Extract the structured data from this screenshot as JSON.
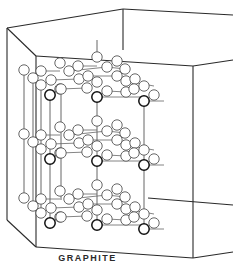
{
  "figure": {
    "caption": "GRAPHITE",
    "colors": {
      "line": "#2a2a2a",
      "background": "#ffffff",
      "atom_fill": "#ffffff"
    }
  },
  "box": {
    "edges": [
      [
        7,
        28,
        123,
        9
      ],
      [
        123,
        9,
        233,
        15
      ],
      [
        7,
        28,
        36,
        56
      ],
      [
        36,
        56,
        193,
        66
      ],
      [
        193,
        66,
        233,
        60
      ],
      [
        123,
        9,
        123,
        50
      ],
      [
        7,
        28,
        7,
        220
      ],
      [
        36,
        56,
        36,
        247
      ],
      [
        193,
        66,
        193,
        258
      ],
      [
        7,
        220,
        36,
        247
      ],
      [
        36,
        247,
        193,
        258
      ],
      [
        193,
        258,
        233,
        252
      ],
      [
        148,
        198,
        233,
        205
      ]
    ]
  },
  "layers": [
    {
      "name": "top-layer",
      "dy": 0
    },
    {
      "name": "middle-layer",
      "dy": 64
    },
    {
      "name": "bottom-layer",
      "dy": 128
    }
  ],
  "atoms": [
    [
      24,
      70
    ],
    [
      41,
      71
    ],
    [
      33,
      78
    ],
    [
      60,
      63
    ],
    [
      69,
      71
    ],
    [
      78,
      66
    ],
    [
      97,
      57
    ],
    [
      107,
      67
    ],
    [
      117,
      61
    ],
    [
      125,
      69
    ],
    [
      41,
      85
    ],
    [
      51,
      80
    ],
    [
      60,
      89
    ],
    [
      79,
      79
    ],
    [
      88,
      76
    ],
    [
      97,
      82
    ],
    [
      117,
      76
    ],
    [
      126,
      81
    ],
    [
      135,
      79
    ],
    [
      144,
      86
    ],
    [
      50,
      95
    ],
    [
      61,
      89
    ],
    [
      87,
      88
    ],
    [
      97,
      97
    ],
    [
      107,
      91
    ],
    [
      126,
      92
    ],
    [
      134,
      89
    ],
    [
      144,
      101
    ],
    [
      154,
      95
    ]
  ],
  "dark_atoms": [
    [
      50,
      95
    ],
    [
      97,
      97
    ],
    [
      144,
      101
    ]
  ],
  "bonds": [
    [
      41,
      71,
      60,
      71
    ],
    [
      69,
      71,
      107,
      67
    ],
    [
      78,
      66,
      97,
      66
    ],
    [
      107,
      67,
      125,
      69
    ],
    [
      51,
      80,
      79,
      79
    ],
    [
      88,
      76,
      117,
      76
    ],
    [
      60,
      89,
      87,
      88
    ],
    [
      107,
      91,
      126,
      92
    ],
    [
      61,
      89,
      50,
      95
    ],
    [
      97,
      97,
      144,
      97
    ],
    [
      126,
      81,
      154,
      86
    ],
    [
      144,
      101,
      164,
      101
    ]
  ],
  "verticals": [
    [
      24,
      75,
      24,
      200
    ],
    [
      33,
      83,
      33,
      210
    ],
    [
      41,
      90,
      41,
      215
    ],
    [
      50,
      100,
      50,
      228
    ],
    [
      61,
      94,
      61,
      200
    ],
    [
      97,
      102,
      97,
      230
    ],
    [
      144,
      106,
      144,
      232
    ],
    [
      97,
      60,
      97,
      40
    ]
  ]
}
